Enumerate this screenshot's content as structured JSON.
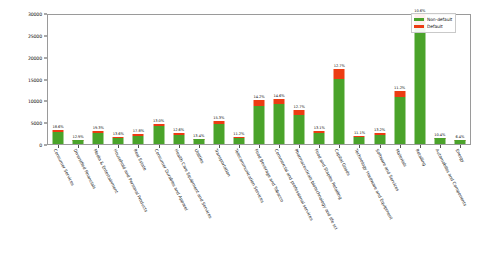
{
  "chart_data": {
    "type": "bar",
    "title": "",
    "xlabel": "",
    "ylabel": "",
    "ylim": [
      0,
      30000
    ],
    "grid": false,
    "stacked": true,
    "legend_position": "top-right",
    "colors": {
      "non_default": "#4aa32a",
      "default": "#ec3c13",
      "frame": "#9a9a9a",
      "text": "#111111",
      "background": "#ffffff"
    },
    "yticks": [
      "0",
      "5000",
      "10000",
      "15000",
      "20000",
      "25000",
      "30000"
    ],
    "ytick_values": [
      0,
      5000,
      10000,
      15000,
      20000,
      25000,
      30000
    ],
    "legend": [
      {
        "label": "Non-default",
        "color": "#4aa32a"
      },
      {
        "label": "Default",
        "color": "#ec3c13"
      }
    ],
    "categories": [
      "Consumer Services",
      "Diversified Financials",
      "Media & Entertainment",
      "Household and Personal Products",
      "Real Estate",
      "Consumer Durables and Apparel",
      "Health Care Equipment and Services",
      "Utilities",
      "Transportation",
      "Telecommunication Services",
      "Food Beverage and Tobacco",
      "Commercial and professional services",
      "Pharmaceuticals biotechnology and life sci",
      "Food and Staples Retailing",
      "Capital Goods",
      "Technology Hardware and Equipment",
      "Software and Services",
      "Materials",
      "Retailing",
      "Automobiles and Components",
      "Energy"
    ],
    "series": [
      {
        "name": "Non-default",
        "values": [
          2750,
          880,
          2450,
          1500,
          1850,
          4150,
          2200,
          1100,
          4600,
          1350,
          8800,
          9250,
          6850,
          2500,
          15200,
          1650,
          2150,
          10900,
          27800,
          1300,
          900
        ]
      },
      {
        "name": "Default",
        "values": [
          600,
          130,
          480,
          230,
          480,
          620,
          320,
          170,
          700,
          170,
          1450,
          1150,
          1000,
          420,
          2350,
          230,
          330,
          1350,
          2400,
          150,
          70
        ]
      }
    ],
    "bar_labels": [
      "18.6%",
      "12.9%",
      "19.3%",
      "13.6%",
      "17.8%",
      "13.0%",
      "12.6%",
      "13.4%",
      "15.3%",
      "11.2%",
      "14.2%",
      "14.6%",
      "12.7%",
      "13.1%",
      "12.7%",
      "11.1%",
      "13.2%",
      "11.2%",
      "10.6%",
      "10.4%",
      "6.4%"
    ]
  }
}
